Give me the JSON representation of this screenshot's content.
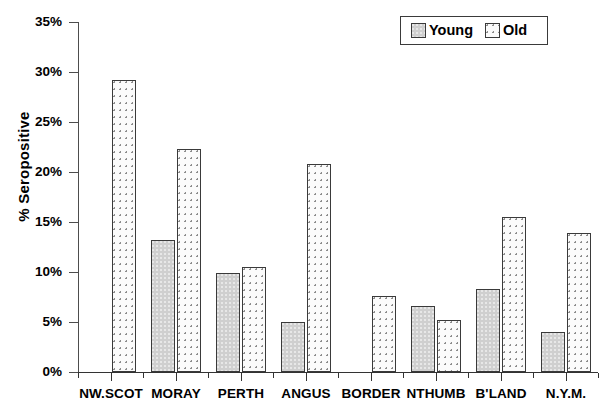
{
  "chart_data": {
    "type": "bar",
    "title": "",
    "xlabel": "",
    "ylabel": "% Seropositive",
    "ylim": [
      0,
      35
    ],
    "ytick_values": [
      0,
      5,
      10,
      15,
      20,
      25,
      30,
      35
    ],
    "ytick_labels": [
      "0%",
      "5%",
      "10%",
      "15%",
      "20%",
      "25%",
      "30%",
      "35%"
    ],
    "grid": false,
    "legend_position": "top-right",
    "categories": [
      "NW.SCOT",
      "MORAY",
      "PERTH",
      "ANGUS",
      "BORDER",
      "NTHUMB",
      "B'LAND",
      "N.Y.M."
    ],
    "series": [
      {
        "name": "Young",
        "fill": "solid-grey",
        "color": "#cfcfcf",
        "values": [
          null,
          13.2,
          9.9,
          5.0,
          null,
          6.6,
          8.3,
          4.0
        ]
      },
      {
        "name": "Old",
        "fill": "dotted-white",
        "color": "#fbfbfb",
        "values": [
          29.2,
          22.3,
          10.5,
          20.8,
          7.6,
          5.2,
          15.5,
          13.9
        ]
      }
    ]
  },
  "legend": {
    "entries": [
      {
        "label": "Young",
        "swatch": "grey-solid-swatch"
      },
      {
        "label": "Old",
        "swatch": "white-dotted-swatch"
      }
    ]
  },
  "axis": {
    "y_title": "% Seropositive"
  }
}
